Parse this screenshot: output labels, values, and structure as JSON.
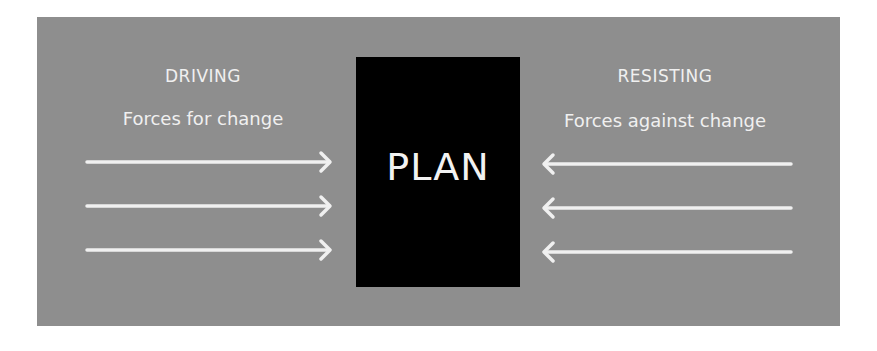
{
  "diagram": {
    "type": "force-field-analysis",
    "center": {
      "label": "PLAN",
      "color": "#000000"
    },
    "background_color": "#8e8e8e",
    "left": {
      "title": "DRIVING",
      "subtitle": "Forces for change",
      "arrow_count": 3,
      "arrow_direction": "right"
    },
    "right": {
      "title": "RESISTING",
      "subtitle": "Forces against change",
      "arrow_count": 3,
      "arrow_direction": "left"
    }
  }
}
